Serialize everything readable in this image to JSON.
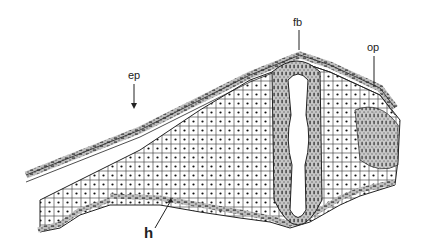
{
  "figure": {
    "type": "histological line drawing",
    "background": "#ffffff",
    "ink_color": "#1a1a1a",
    "labels": [
      {
        "id": "ep",
        "text": "ep",
        "x": 128,
        "y": 72
      },
      {
        "id": "fb",
        "text": "fb",
        "x": 296,
        "y": 20
      },
      {
        "id": "op",
        "text": "op",
        "x": 369,
        "y": 44
      },
      {
        "id": "h",
        "text": "h",
        "x": 145,
        "y": 227
      }
    ]
  }
}
